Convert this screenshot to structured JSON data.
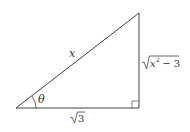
{
  "diagram": {
    "type": "right-triangle",
    "colors": {
      "stroke": "#444444",
      "text": "#333333",
      "background": "#ffffff"
    },
    "vertices": {
      "left": [
        16,
        108
      ],
      "right_angle": [
        139,
        108
      ],
      "top": [
        139,
        13
      ]
    },
    "labels": {
      "hypotenuse": "x",
      "opposite_radicand_var": "x",
      "opposite_exponent": "2",
      "opposite_rest": " − 3",
      "adjacent_radicand": "3",
      "angle": "θ"
    },
    "sides": {
      "hypotenuse": "x",
      "opposite": "√(x² − 3)",
      "adjacent": "√3"
    },
    "right_angle_marker": true,
    "angle_arc": true
  }
}
